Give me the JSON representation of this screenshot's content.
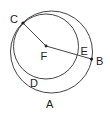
{
  "diagram": {
    "type": "geometry-circles",
    "stroke_color": "#444444",
    "circles": [
      {
        "name": "A",
        "cx": 51.5,
        "cy": 52,
        "r": 41
      },
      {
        "name": "D",
        "cx": 46,
        "cy": 46.5,
        "r": 32.5
      }
    ],
    "points": [
      {
        "name": "C",
        "x": 23,
        "y": 23
      },
      {
        "name": "F",
        "x": 46,
        "y": 46
      },
      {
        "name": "B",
        "x": 91.5,
        "y": 59
      }
    ],
    "segments": [
      {
        "from": "C",
        "to": "F"
      },
      {
        "from": "F",
        "to": "B"
      }
    ],
    "labels": {
      "C": "C",
      "F": "F",
      "E": "E",
      "B": "B",
      "D": "D",
      "A": "A"
    }
  }
}
